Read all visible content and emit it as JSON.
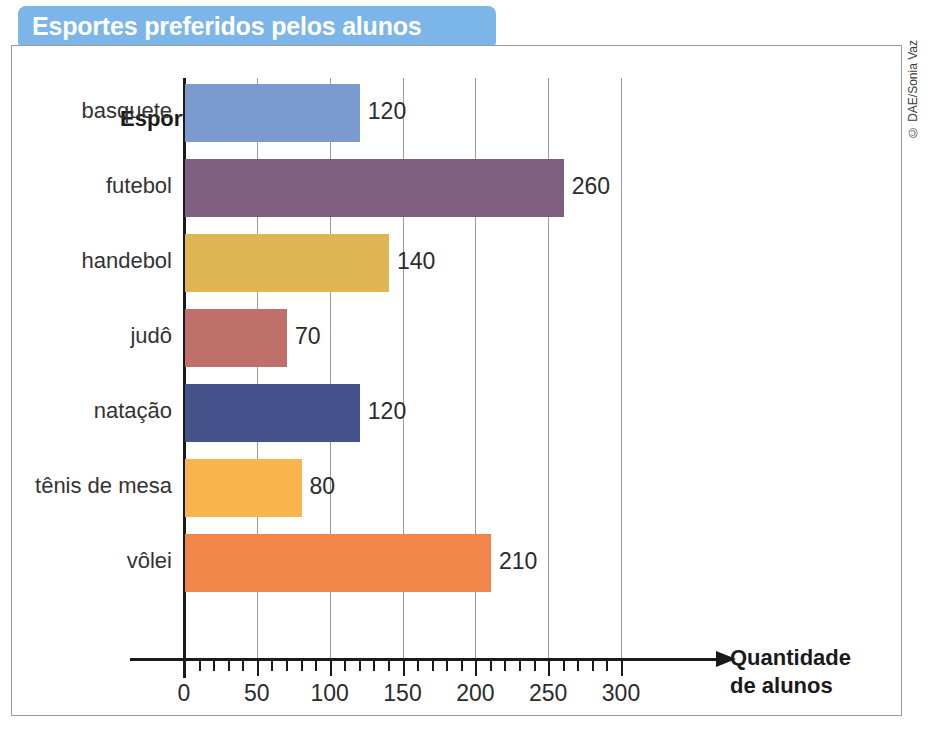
{
  "title": "Esportes preferidos pelos alunos",
  "credit": "© DAE/Sonia Vaz",
  "colors": {
    "banner": "#7cb6e8",
    "axis": "#1a1a1a",
    "grid": "#9b9b9b",
    "frame": "#9a9a9a"
  },
  "chart_data": {
    "type": "bar",
    "orientation": "horizontal",
    "title": "Esportes preferidos pelos alunos",
    "xlabel": "Quantidade de alunos",
    "ylabel": "Esporte",
    "xlabel_line1": "Quantidade",
    "xlabel_line2": "de alunos",
    "categories": [
      "basquete",
      "futebol",
      "handebol",
      "judô",
      "natação",
      "tênis de mesa",
      "vôlei"
    ],
    "values": [
      120,
      260,
      140,
      70,
      120,
      80,
      210
    ],
    "bar_colors": [
      "#7b9bd0",
      "#7e5f80",
      "#dfb653",
      "#c0706a",
      "#46528c",
      "#f9b44e",
      "#f1854a"
    ],
    "xlim": [
      0,
      300
    ],
    "xticks": [
      0,
      50,
      100,
      150,
      200,
      250,
      300
    ],
    "xtick_labels": [
      "0",
      "50",
      "100",
      "150",
      "200",
      "250",
      "300"
    ],
    "minor_tick_step": 10,
    "grid": "vertical-major-only",
    "legend": "none",
    "data_labels": [
      "120",
      "260",
      "140",
      "70",
      "120",
      "80",
      "210"
    ]
  }
}
